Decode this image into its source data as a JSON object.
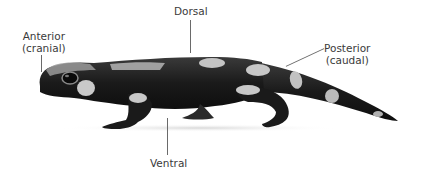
{
  "diagram": {
    "labels": {
      "anterior": {
        "line1": "Anterior",
        "line2": "(cranial)"
      },
      "dorsal": {
        "text": "Dorsal"
      },
      "posterior": {
        "line1": "Posterior",
        "line2": "(caudal)"
      },
      "ventral": {
        "text": "Ventral"
      }
    },
    "colors": {
      "background": "#ffffff",
      "body": "#1c1c1c",
      "spots": "#cfcfcf",
      "label_text": "#3a3a3a",
      "leader_line": "#6a6a6a"
    }
  }
}
